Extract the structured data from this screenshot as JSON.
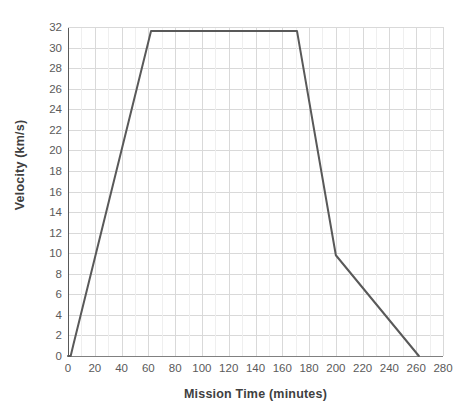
{
  "chart_data": {
    "type": "line",
    "title": "",
    "xlabel": "Mission Time (minutes)",
    "ylabel": "Velocity (km/s)",
    "xlim": [
      0,
      280
    ],
    "ylim": [
      0,
      32
    ],
    "grid": true,
    "legend": false,
    "x_ticks": [
      0,
      20,
      40,
      60,
      80,
      100,
      120,
      140,
      160,
      180,
      200,
      220,
      240,
      260,
      280
    ],
    "y_ticks": [
      0,
      2,
      4,
      6,
      8,
      10,
      12,
      14,
      16,
      18,
      20,
      22,
      24,
      26,
      28,
      30,
      32
    ],
    "line_color": "#595959",
    "grid_color": "#d9d9d9",
    "axis_color": "#808080",
    "series": [
      {
        "name": "Velocity",
        "x": [
          0,
          2,
          4,
          62,
          171,
          200,
          262
        ],
        "values": [
          0,
          0,
          1.1,
          31.6,
          31.6,
          9.8,
          0
        ]
      }
    ]
  },
  "axis_titles": {
    "x": "Mission Time (minutes)",
    "y": "Velocity (km/s)"
  }
}
